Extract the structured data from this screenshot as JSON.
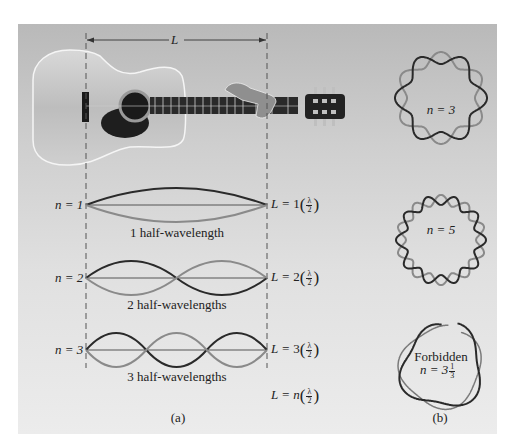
{
  "figure": {
    "panel_a": {
      "length_label": "L",
      "modes": [
        {
          "n_label": "n = 1",
          "n_value": "1",
          "caption": "1 half-wavelength",
          "L_prefix": "L = ",
          "L_coef": "1",
          "frac_num": "λ",
          "frac_den": "2"
        },
        {
          "n_label": "n = 2",
          "n_value": "2",
          "caption": "2 half-wavelengths",
          "L_prefix": "L = ",
          "L_coef": "2",
          "frac_num": "λ",
          "frac_den": "2"
        },
        {
          "n_label": "n = 3",
          "n_value": "3",
          "caption": "3 half-wavelengths",
          "L_prefix": "L = ",
          "L_coef": "3",
          "frac_num": "λ",
          "frac_den": "2"
        }
      ],
      "general": {
        "L_prefix": "L = ",
        "L_coef": "n",
        "frac_num": "λ",
        "frac_den": "2"
      },
      "panel_label": "(a)"
    },
    "panel_b": {
      "rings": [
        {
          "label": "n = 3",
          "allowed": true
        },
        {
          "label": "n = 5",
          "allowed": true
        },
        {
          "label_line1": "Forbidden",
          "label_line2_prefix": "n = 3",
          "frac_num": "1",
          "frac_den": "3",
          "allowed": false
        }
      ],
      "panel_label": "(b)"
    },
    "colors": {
      "dark_wave": "#2a2a2a",
      "light_wave": "#8a8a8a",
      "axis_line": "#555555",
      "dashed_line": "#555555",
      "panel_top": "#b9b9b9",
      "panel_bottom": "#ececec"
    }
  }
}
